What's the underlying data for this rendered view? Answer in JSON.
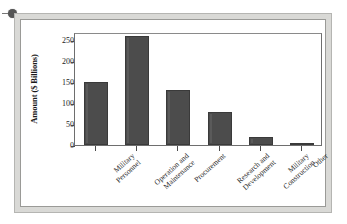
{
  "figure": {
    "bullet_marker": "bullet-dot"
  },
  "chart_data": {
    "type": "bar",
    "title": "",
    "xlabel": "",
    "ylabel": "Amount ($ Billions)",
    "ylim": [
      0,
      270
    ],
    "yticks": [
      0,
      50,
      100,
      150,
      200,
      250
    ],
    "ytick_labels": [
      "0",
      "50",
      "100",
      "150",
      "200",
      "250"
    ],
    "grid": false,
    "legend": false,
    "bar_color": "#4c4c4c",
    "categories": [
      "Military Personnel",
      "Operation and Maintenance",
      "Procurement",
      "Research and Development",
      "Military Construction",
      "Other"
    ],
    "category_lines": [
      [
        "Military",
        "Personnel"
      ],
      [
        "Operation and",
        "Maintenance"
      ],
      [
        "Procurement",
        ""
      ],
      [
        "Research and",
        "Development"
      ],
      [
        "Military",
        "Construction"
      ],
      [
        "Other",
        ""
      ]
    ],
    "values": [
      150,
      260,
      132,
      80,
      20,
      5
    ]
  }
}
